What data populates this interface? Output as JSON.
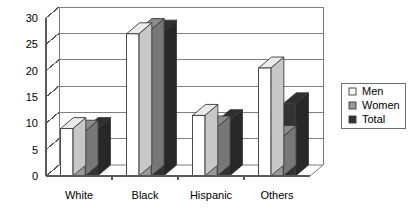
{
  "chart_data": {
    "type": "bar",
    "title": "",
    "subtitle": "",
    "xlabel": "",
    "ylabel": "",
    "categories": [
      "White",
      "Black",
      "Hispanic",
      "Others"
    ],
    "series": [
      {
        "name": "Men",
        "color": "#ffffff",
        "values": [
          9.0,
          27.0,
          11.5,
          20.5
        ]
      },
      {
        "name": "Women",
        "color": "#999999",
        "values": [
          8.5,
          27.8,
          9.3,
          7.5
        ]
      },
      {
        "name": "Total",
        "color": "#333333",
        "values": [
          9.0,
          27.5,
          10.5,
          13.7
        ]
      }
    ],
    "ylim": [
      0,
      30
    ],
    "yticks": [
      0,
      5,
      10,
      15,
      20,
      25,
      30
    ],
    "ytick_labels": [
      "0",
      "5",
      "10",
      "15",
      "20",
      "25",
      "30"
    ],
    "grid": true,
    "grid_axis": "y",
    "legend": {
      "position": "right",
      "entries": [
        {
          "label": "Men",
          "color": "#ffffff"
        },
        {
          "label": "Women",
          "color": "#999999"
        },
        {
          "label": "Total",
          "color": "#333333"
        }
      ]
    },
    "style": "3d-column",
    "colors": {
      "axis": "#595959",
      "grid": "#808080",
      "outline": "#3a3a3a",
      "background": "#ffffff",
      "legend_border": "#6e6e6e"
    }
  }
}
